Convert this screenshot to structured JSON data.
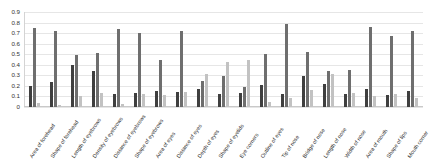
{
  "chart_data": {
    "type": "bar",
    "title": "",
    "subtitle": "",
    "xlabel": "",
    "ylabel": "",
    "ylim": [
      0,
      0.9
    ],
    "grid": true,
    "legend": "none",
    "yticks": [
      "0.9",
      "0.8",
      "0.7",
      "0.6",
      "0.5",
      "0.4",
      "0.3",
      "0.2",
      "0.1",
      "0"
    ],
    "categories": [
      "Area of forehead",
      "Shape of forehead",
      "Length of eyebrows",
      "Density of eyebrows",
      "Distance of eyebrows",
      "Shape of eyebrows",
      "Area of eyes",
      "Distance of eyes",
      "Depth of eyes",
      "Shape of eyelids",
      "Eye corners",
      "Outline of eyes",
      "Tip of nose",
      "Bridge of nose",
      "Length of nose",
      "Width of nose",
      "Area of mouth",
      "Shape of lips",
      "Mouth corner"
    ],
    "series": [
      {
        "name": "Series 1",
        "color": "#3f3f3f",
        "values": [
          0.2,
          0.24,
          0.4,
          0.34,
          0.12,
          0.13,
          0.15,
          0.14,
          0.17,
          0.12,
          0.13,
          0.21,
          0.12,
          0.29,
          0.22,
          0.12,
          0.17,
          0.11,
          0.15
        ]
      },
      {
        "name": "Series 2",
        "color": "#6e6e6e",
        "values": [
          0.75,
          0.72,
          0.49,
          0.51,
          0.74,
          0.7,
          0.45,
          0.72,
          0.25,
          0.29,
          0.19,
          0.5,
          0.79,
          0.52,
          0.34,
          0.35,
          0.76,
          0.67,
          0.72
        ]
      },
      {
        "name": "Series 3",
        "color": "#c2c2c2",
        "values": [
          0.04,
          0.02,
          0.1,
          0.13,
          0.03,
          0.12,
          0.11,
          0.14,
          0.31,
          0.43,
          0.45,
          0.05,
          0.09,
          0.16,
          0.31,
          0.13,
          0.1,
          0.12,
          0.09
        ]
      }
    ]
  }
}
